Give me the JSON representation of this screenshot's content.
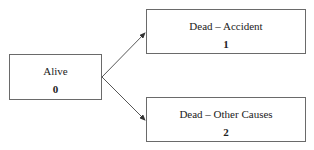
{
  "diagram": {
    "type": "state-transition",
    "nodes": [
      {
        "id": "alive",
        "label": "Alive",
        "state": "0"
      },
      {
        "id": "dead-accident",
        "label": "Dead – Accident",
        "state": "1"
      },
      {
        "id": "dead-other",
        "label": "Dead – Other Causes",
        "state": "2"
      }
    ],
    "edges": [
      {
        "from": "alive",
        "to": "dead-accident"
      },
      {
        "from": "alive",
        "to": "dead-other"
      }
    ],
    "colors": {
      "border": "#6a6a6a",
      "arrow": "#333333",
      "text": "#222222"
    }
  }
}
